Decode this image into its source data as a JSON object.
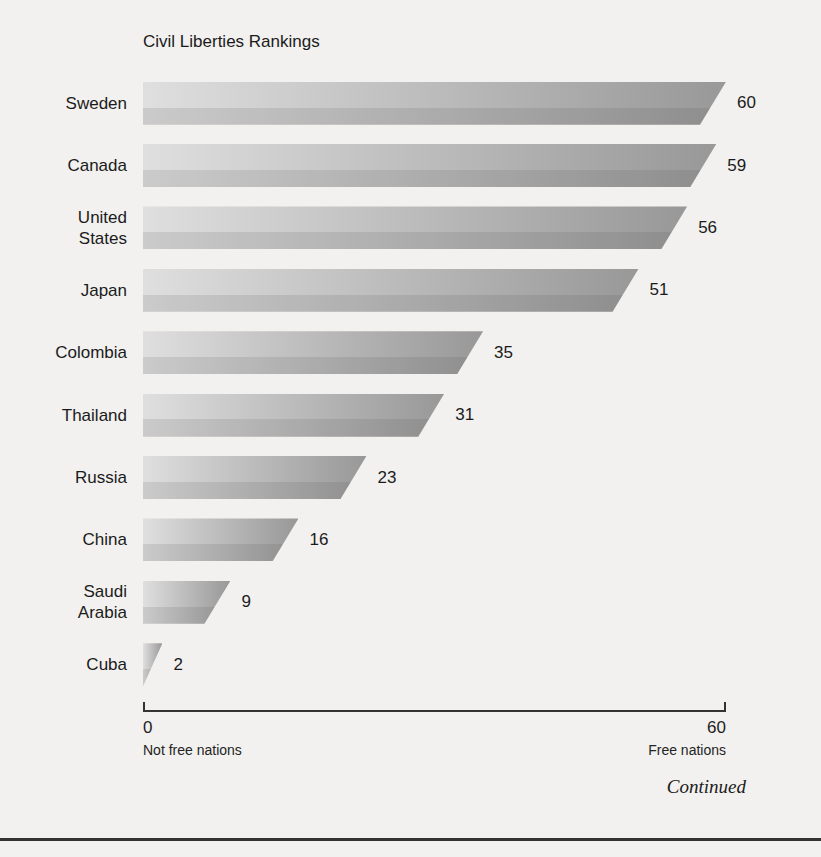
{
  "chart_data": {
    "type": "bar",
    "orientation": "horizontal",
    "title": "Civil Liberties Rankings",
    "categories": [
      "Sweden",
      "Canada",
      "United States",
      "Japan",
      "Colombia",
      "Thailand",
      "Russia",
      "China",
      "Saudi Arabia",
      "Cuba"
    ],
    "values": [
      60,
      59,
      56,
      51,
      35,
      31,
      23,
      16,
      9,
      2
    ],
    "value_labels_shown": true,
    "xlabel": "",
    "ylabel": "",
    "xlim": [
      0,
      60
    ],
    "xticks": [
      0,
      60
    ],
    "xtick_left_caption": "Not free nations",
    "xtick_right_caption": "Free nations",
    "grid": false,
    "legend": "none"
  },
  "axis": {
    "min_label": "0",
    "max_label": "60",
    "min_caption": "Not free nations",
    "max_caption": "Free nations"
  },
  "footer": {
    "continued_label": "Continued"
  },
  "style": {
    "background": "#f2f1ef",
    "bar_gradient_left": "#dfdfdf",
    "bar_gradient_right": "#989898",
    "bar_shadow_band": "rgba(70,70,70,0.13)",
    "text_color": "#1e1e1e",
    "rule_color": "#333333"
  }
}
